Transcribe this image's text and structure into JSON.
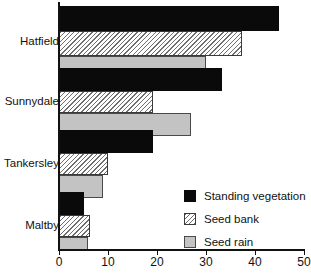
{
  "chart_data": {
    "type": "bar",
    "orientation": "horizontal",
    "title": "",
    "subtitle": "",
    "xlabel": "",
    "ylabel": "",
    "categories": [
      "Hatfield",
      "Sunnydale",
      "Tankersley",
      "Maltby"
    ],
    "series": [
      {
        "name": "Standing vegetation",
        "color": "#0a0a0a",
        "pattern": "solid-black",
        "values": [
          44.7,
          33.2,
          19.1,
          5.1
        ]
      },
      {
        "name": "Seed bank",
        "color": "#e8e8e8",
        "pattern": "diagonal-hatch",
        "values": [
          37.1,
          19.1,
          10.0,
          6.4
        ]
      },
      {
        "name": "Seed rain",
        "color": "#c3c3c3",
        "pattern": "solid-grey",
        "values": [
          29.9,
          26.8,
          9.0,
          5.9
        ]
      }
    ],
    "xlim": [
      0,
      50
    ],
    "xticks": [
      0,
      10,
      20,
      30,
      40,
      50
    ],
    "xtick_labels": [
      "0",
      "10",
      "20",
      "30",
      "40",
      "50"
    ],
    "grid": false,
    "legend_position": "inside-lower-right",
    "legend_entries": [
      "Standing vegetation",
      "Seed bank",
      "Seed rain"
    ]
  },
  "axis": {
    "ticks": [
      {
        "value": 0,
        "label": "0"
      },
      {
        "value": 10,
        "label": "10"
      },
      {
        "value": 20,
        "label": "20"
      },
      {
        "value": 30,
        "label": "30"
      },
      {
        "value": 40,
        "label": "40"
      },
      {
        "value": 50,
        "label": "50"
      }
    ]
  },
  "categories": [
    {
      "label": "Hatfield"
    },
    {
      "label": "Sunnydale"
    },
    {
      "label": "Tankersley"
    },
    {
      "label": "Maltby"
    }
  ],
  "legend": {
    "items": [
      {
        "label": "Standing vegetation",
        "swatch": "black-square-icon"
      },
      {
        "label": "Seed bank",
        "swatch": "hatched-square-icon"
      },
      {
        "label": "Seed rain",
        "swatch": "grey-square-icon"
      }
    ]
  }
}
